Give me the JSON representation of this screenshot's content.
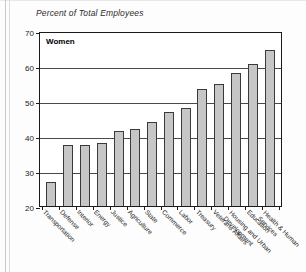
{
  "figure": {
    "title": "Percent of Total Employees",
    "series_label": "Women"
  },
  "chart_data": {
    "type": "bar",
    "title": "Percent of Total Employees",
    "subtitle": "Women",
    "xlabel": "",
    "ylabel": "Percent of Total Employees",
    "ylim": [
      20,
      70
    ],
    "yticks": [
      20,
      30,
      40,
      50,
      60,
      70
    ],
    "ytick_labels": [
      "20",
      "30",
      "40",
      "50",
      "60",
      "70"
    ],
    "grid": true,
    "legend": "none",
    "legend_position": "inside-top-left",
    "bar_color": "#c6c6c6",
    "bar_edge_color": "#3a3a3a",
    "categories": [
      "Transportation",
      "Defense",
      "Interior",
      "Energy",
      "Justice",
      "Agriculture",
      "State",
      "Commerce",
      "Labor",
      "Treasury",
      "Veterans Affairs",
      "Housing and Urban Development",
      "Education",
      "Health & Human Services"
    ],
    "values": [
      27,
      37.5,
      37.5,
      38,
      41.5,
      42,
      44,
      47,
      48,
      53.5,
      55,
      58,
      60.5,
      64.5
    ],
    "series": [
      {
        "name": "Women",
        "values": [
          27,
          37.5,
          37.5,
          38,
          41.5,
          42,
          44,
          47,
          48,
          53.5,
          55,
          58,
          60.5,
          64.5
        ]
      }
    ]
  }
}
